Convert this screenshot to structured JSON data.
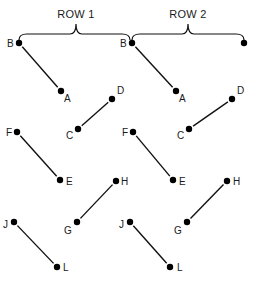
{
  "groups": [
    {
      "title": "ROW 1",
      "brace": {
        "x1": 19,
        "x2": 130,
        "y": 34,
        "peak_x": 76,
        "peak_y": 22,
        "title_x": 76,
        "title_y": 18
      },
      "points": [
        {
          "label": "B",
          "x": 19,
          "y": 43,
          "lx": 7,
          "ly": 47
        },
        {
          "label": "A",
          "x": 61,
          "y": 91,
          "lx": 64,
          "ly": 102
        },
        {
          "label": "D",
          "x": 112,
          "y": 99,
          "lx": 117,
          "ly": 94
        },
        {
          "label": "C",
          "x": 78,
          "y": 129,
          "lx": 66,
          "ly": 139
        },
        {
          "label": "F",
          "x": 17,
          "y": 132,
          "lx": 6,
          "ly": 136
        },
        {
          "label": "E",
          "x": 60,
          "y": 180,
          "lx": 66,
          "ly": 185
        },
        {
          "label": "H",
          "x": 116,
          "y": 181,
          "lx": 121,
          "ly": 185
        },
        {
          "label": "G",
          "x": 77,
          "y": 222,
          "lx": 64,
          "ly": 234
        },
        {
          "label": "J",
          "x": 14,
          "y": 222,
          "lx": 3,
          "ly": 228
        },
        {
          "label": "L",
          "x": 57,
          "y": 267,
          "lx": 63,
          "ly": 271
        }
      ],
      "segments": [
        [
          "B",
          "A"
        ],
        [
          "C",
          "D"
        ],
        [
          "F",
          "E"
        ],
        [
          "G",
          "H"
        ],
        [
          "J",
          "L"
        ]
      ]
    },
    {
      "title": "ROW 2",
      "brace": {
        "x1": 132,
        "x2": 244,
        "y": 34,
        "peak_x": 188,
        "peak_y": 22,
        "title_x": 188,
        "title_y": 18
      },
      "points": [
        {
          "label": "B",
          "x": 132,
          "y": 43,
          "lx": 120,
          "ly": 47
        },
        {
          "label": "",
          "x": 244,
          "y": 43,
          "lx": 0,
          "ly": 0
        },
        {
          "label": "A",
          "x": 176,
          "y": 91,
          "lx": 179,
          "ly": 102
        },
        {
          "label": "D",
          "x": 232,
          "y": 99,
          "lx": 237,
          "ly": 94
        },
        {
          "label": "C",
          "x": 189,
          "y": 129,
          "lx": 177,
          "ly": 139
        },
        {
          "label": "F",
          "x": 133,
          "y": 132,
          "lx": 122,
          "ly": 136
        },
        {
          "label": "E",
          "x": 173,
          "y": 180,
          "lx": 179,
          "ly": 185
        },
        {
          "label": "H",
          "x": 227,
          "y": 181,
          "lx": 233,
          "ly": 185
        },
        {
          "label": "G",
          "x": 187,
          "y": 222,
          "lx": 174,
          "ly": 234
        },
        {
          "label": "J",
          "x": 130,
          "y": 222,
          "lx": 119,
          "ly": 228
        },
        {
          "label": "L",
          "x": 170,
          "y": 267,
          "lx": 177,
          "ly": 271
        }
      ],
      "segments": [
        [
          "B",
          "A"
        ],
        [
          "C",
          "D"
        ],
        [
          "F",
          "E"
        ],
        [
          "G",
          "H"
        ],
        [
          "J",
          "L"
        ]
      ]
    }
  ]
}
